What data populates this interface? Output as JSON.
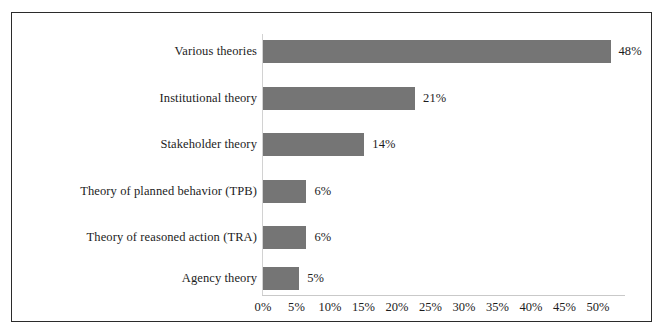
{
  "chart_data": {
    "type": "bar",
    "orientation": "horizontal",
    "title": "",
    "xlabel": "",
    "ylabel": "",
    "xlim": [
      0,
      50
    ],
    "grid": false,
    "legend": false,
    "categories": [
      "Various theories",
      "Institutional theory",
      "Stakeholder theory",
      "Theory of planned behavior (TPB)",
      "Theory of reasoned action (TRA)",
      "Agency theory"
    ],
    "values": [
      48,
      21,
      14,
      6,
      6,
      5
    ],
    "data_labels": [
      "48%",
      "21%",
      "14%",
      "6%",
      "6%",
      "5%"
    ],
    "xticks": [
      0,
      5,
      10,
      15,
      20,
      25,
      30,
      35,
      40,
      45,
      50
    ],
    "xtick_labels": [
      "0%",
      "5%",
      "10%",
      "15%",
      "20%",
      "25%",
      "30%",
      "35%",
      "40%",
      "45%",
      "50%"
    ],
    "colors": {
      "bar_fill": "#757575",
      "frame": "#2b2b2b",
      "axis_line": "#c9c9c9",
      "text": "#1c1c1c",
      "background": "#ffffff"
    }
  }
}
